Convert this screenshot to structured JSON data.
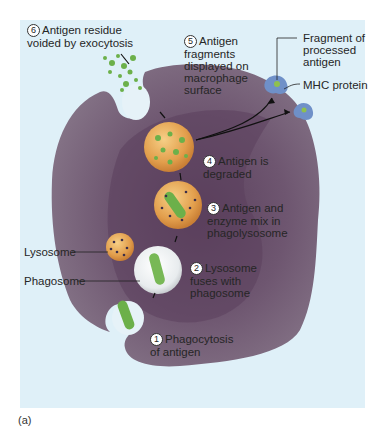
{
  "figure": {
    "caption": "(a)",
    "colors": {
      "background": "#dff0f8",
      "cell": "#7a6478",
      "cell_dark": "#5e4860",
      "vesicle_orange": "#e0a050",
      "antigen_green": "#6cb04a",
      "mhc_blue": "#6f90c8"
    }
  },
  "steps": [
    {
      "n": "1",
      "text": "Phagocytosis\nof antigen"
    },
    {
      "n": "2",
      "text": "Lysosome\nfuses with\nphagosome"
    },
    {
      "n": "3",
      "text": "Antigen and\nenzyme mix in\nphagolysosome"
    },
    {
      "n": "4",
      "text": "Antigen is\ndegraded"
    },
    {
      "n": "5",
      "text": "Antigen\nfragments\ndisplayed on\nmacrophage\nsurface"
    },
    {
      "n": "6",
      "text": "Antigen residue\nvoided by exocytosis"
    }
  ],
  "labels": {
    "lysosome": "Lysosome",
    "phagosome": "Phagosome",
    "fragment": "Fragment of\nprocessed\nantigen",
    "mhc": "MHC protein"
  }
}
